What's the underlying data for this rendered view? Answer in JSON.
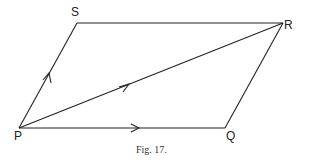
{
  "figure": {
    "caption": "Fig. 17.",
    "line_color": "#222222",
    "vertices": {
      "P": {
        "label": "P",
        "x": 19,
        "y": 128
      },
      "Q": {
        "label": "Q",
        "x": 225,
        "y": 128
      },
      "R": {
        "label": "R",
        "x": 283,
        "y": 23
      },
      "S": {
        "label": "S",
        "x": 77,
        "y": 23
      }
    },
    "edges": [
      {
        "from": "P",
        "to": "Q",
        "arrow": true
      },
      {
        "from": "Q",
        "to": "R",
        "arrow": false
      },
      {
        "from": "R",
        "to": "S",
        "arrow": false
      },
      {
        "from": "S",
        "to": "P",
        "arrow": true,
        "arrow_direction": "P-to-S"
      },
      {
        "from": "P",
        "to": "R",
        "arrow": true
      }
    ]
  }
}
